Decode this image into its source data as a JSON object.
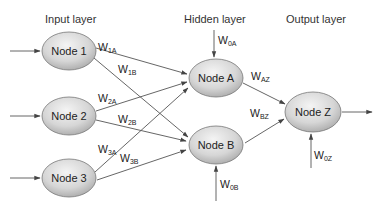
{
  "layers": {
    "input": "Input layer",
    "hidden": "Hidden layer",
    "output": "Output layer"
  },
  "nodes": {
    "n1": "Node 1",
    "n2": "Node 2",
    "n3": "Node 3",
    "nA": "Node A",
    "nB": "Node B",
    "nZ": "Node Z"
  },
  "weights": {
    "w1A": {
      "base": "W",
      "sub": "1A"
    },
    "w1B": {
      "base": "W",
      "sub": "1B"
    },
    "w2A": {
      "base": "W",
      "sub": "2A"
    },
    "w2B": {
      "base": "W",
      "sub": "2B"
    },
    "w3A": {
      "base": "W",
      "sub": "3A"
    },
    "w3B": {
      "base": "W",
      "sub": "3B"
    },
    "w0A": {
      "base": "W",
      "sub": "0A"
    },
    "w0B": {
      "base": "W",
      "sub": "0B"
    },
    "wAZ": {
      "base": "W",
      "sub": "AZ"
    },
    "wBZ": {
      "base": "W",
      "sub": "BZ"
    },
    "w0Z": {
      "base": "W",
      "sub": "0Z"
    }
  },
  "colors": {
    "node_fill_light": "#f2f2f2",
    "node_fill_dark": "#b8b8b8",
    "edge": "#555555"
  }
}
